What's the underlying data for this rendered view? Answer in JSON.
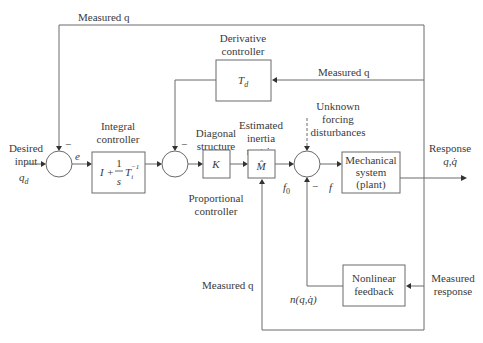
{
  "diagram": {
    "type": "control-block-diagram",
    "signals": {
      "top_feedback": "Measured q",
      "derivative_feedback": "Measured q",
      "bottom_feedback": "Measured q",
      "desired_input_line1": "Desired",
      "desired_input_line2": "input",
      "desired_input_symbol": "q",
      "desired_input_sub": "d",
      "error": "e",
      "f0_symbol": "f",
      "f0_sub": "0",
      "f": "f",
      "nonlinear_output": "n(q,q̇)",
      "response_line1": "Response",
      "response_line2": "q,q̇",
      "measured_response_line1": "Measured",
      "measured_response_line2": "response",
      "disturbance_line1": "Unknown",
      "disturbance_line2": "forcing",
      "disturbance_line3": "disturbances",
      "minus_sign": "−"
    },
    "blocks": {
      "derivative": {
        "title_line1": "Derivative",
        "title_line2": "controller",
        "symbol": "T",
        "sub": "d"
      },
      "integral": {
        "title_line1": "Integral",
        "title_line2": "controller",
        "expr_I": "I +",
        "expr_num": "1",
        "expr_den": "s",
        "expr_T": "T",
        "expr_sub": "i",
        "expr_sup": "−1"
      },
      "proportional": {
        "title_line1": "Diagonal",
        "title_line2": "structure",
        "symbol": "K",
        "caption_line1": "Proportional",
        "caption_line2": "controller"
      },
      "inertia": {
        "title_line1": "Estimated",
        "title_line2": "inertia",
        "title_line3": "matrix",
        "symbol": "M̂"
      },
      "plant": {
        "line1": "Mechanical",
        "line2": "system",
        "line3": "(plant)"
      },
      "nonlinear": {
        "line1": "Nonlinear",
        "line2": "feedback"
      }
    }
  }
}
